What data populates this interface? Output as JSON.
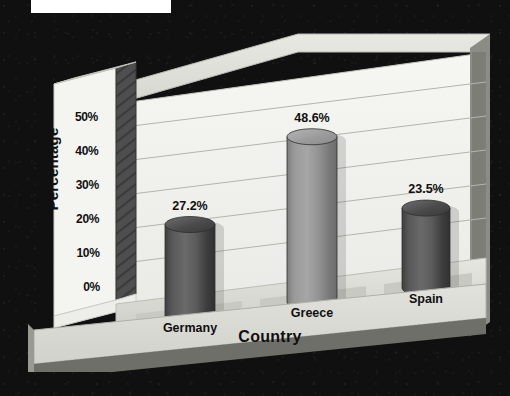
{
  "chart_data": {
    "type": "bar",
    "title": "",
    "subtitle": "",
    "xlabel": "Country",
    "ylabel": "Percentage",
    "categories": [
      "Germany",
      "Greece",
      "Spain"
    ],
    "values": [
      27.2,
      48.6,
      23.5
    ],
    "value_labels": [
      "27.2%",
      "48.6%",
      "23.5%"
    ],
    "ylim": [
      0,
      55
    ],
    "ytick_values": [
      0,
      10,
      20,
      30,
      40,
      50
    ],
    "ytick_labels": [
      "0%",
      "10%",
      "20%",
      "30%",
      "40%",
      "50%"
    ],
    "grid": true,
    "grid_axis": "y",
    "legend": "none",
    "style": "3d-cylinder",
    "bar_colors": [
      "#5a5a5a",
      "#8e8e8e",
      "#5f5f5f"
    ],
    "plot_bg": "#f2f2ef",
    "page_bg": "#101010"
  },
  "axes": {
    "y": {
      "label": "Percentage",
      "ticks": [
        "50%",
        "40%",
        "30%",
        "20%",
        "10%",
        "0%"
      ]
    },
    "x": {
      "label": "Country",
      "ticks": [
        "Germany",
        "Greece",
        "Spain"
      ]
    }
  },
  "bars": [
    {
      "category": "Germany",
      "value": 27.2,
      "label": "27.2%"
    },
    {
      "category": "Greece",
      "value": 48.6,
      "label": "48.6%"
    },
    {
      "category": "Spain",
      "value": 23.5,
      "label": "23.5%"
    }
  ]
}
